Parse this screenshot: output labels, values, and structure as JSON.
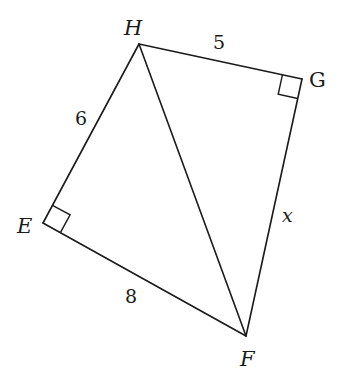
{
  "figure": {
    "type": "quadrilateral-with-diagonal",
    "vertices": {
      "H": {
        "label": "H",
        "x": 139,
        "y": 44
      },
      "G": {
        "label": "G",
        "x": 302,
        "y": 79
      },
      "F": {
        "label": "F",
        "x": 246,
        "y": 336
      },
      "E": {
        "label": "E",
        "x": 43,
        "y": 223
      }
    },
    "edges": [
      {
        "from": "H",
        "to": "G",
        "label": "5"
      },
      {
        "from": "G",
        "to": "F",
        "label": "x"
      },
      {
        "from": "F",
        "to": "E",
        "label": "8"
      },
      {
        "from": "E",
        "to": "H",
        "label": "6"
      },
      {
        "from": "H",
        "to": "F",
        "label": ""
      }
    ],
    "right_angles": [
      "G",
      "E"
    ],
    "labels": {
      "H": "H",
      "G": "G",
      "E": "E",
      "F": "F",
      "HG": "5",
      "GF": "x",
      "FE": "8",
      "EH": "6"
    },
    "colors": {
      "stroke": "#1a1a1a",
      "background": "#ffffff"
    }
  }
}
